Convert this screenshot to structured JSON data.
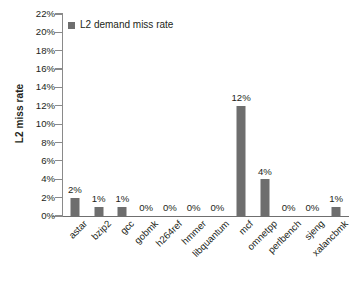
{
  "chart_data": {
    "type": "bar",
    "title": "",
    "subtitle": "",
    "xlabel": "",
    "ylabel": "L2 miss rate",
    "ylim": [
      0,
      22
    ],
    "ytick_step": 2,
    "grid": false,
    "legend_position": "top-left",
    "value_suffix": "%",
    "bar_color": "#6e6e6e",
    "axis_color": "#8a8a8a",
    "text_color": "#231f20",
    "series": [
      {
        "name": "L2 demand miss rate",
        "values": [
          2,
          1,
          1,
          0,
          0,
          0,
          0,
          12,
          4,
          0,
          0,
          1
        ]
      }
    ],
    "categories": [
      "astar",
      "bzip2",
      "gcc",
      "gobmk",
      "h264ref",
      "hmmer",
      "libquantum",
      "mcf",
      "omnetpp",
      "perlbench",
      "sjeng",
      "xalancbmk"
    ],
    "data_labels": [
      "2%",
      "1%",
      "1%",
      "0%",
      "0%",
      "0%",
      "0%",
      "12%",
      "4%",
      "0%",
      "0%",
      "1%"
    ],
    "ytick_labels": [
      "0%",
      "2%",
      "4%",
      "6%",
      "8%",
      "10%",
      "12%",
      "14%",
      "16%",
      "18%",
      "20%",
      "22%"
    ],
    "legend": [
      {
        "label": "L2 demand miss rate",
        "color": "#6e6e6e",
        "marker": "square"
      }
    ]
  }
}
